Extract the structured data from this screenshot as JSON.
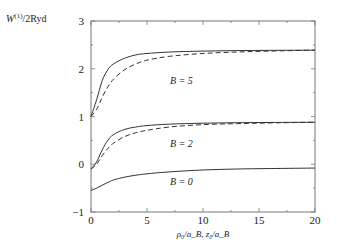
{
  "chart_data": {
    "type": "line",
    "title": "",
    "ylabel": "W^(1)/2Ryd",
    "xlabel": "ρ0/aB, z0/aB",
    "xlim": [
      0,
      20
    ],
    "ylim": [
      -1,
      3
    ],
    "xticks": [
      0,
      5,
      10,
      15,
      20
    ],
    "yticks": [
      -1,
      0,
      1,
      2,
      3
    ],
    "grid": false,
    "legend": "inline annotations",
    "x": [
      0,
      0.5,
      1,
      1.5,
      2,
      3,
      4,
      5,
      7,
      10,
      13,
      16,
      20
    ],
    "series": [
      {
        "name": "B = 5 (solid)",
        "style": "solid",
        "values": [
          1.0,
          1.35,
          1.75,
          1.98,
          2.1,
          2.22,
          2.29,
          2.32,
          2.35,
          2.37,
          2.38,
          2.385,
          2.39
        ]
      },
      {
        "name": "B = 5 (dashed)",
        "style": "dashed",
        "values": [
          1.0,
          1.15,
          1.4,
          1.62,
          1.78,
          1.98,
          2.1,
          2.18,
          2.26,
          2.32,
          2.35,
          2.37,
          2.39
        ]
      },
      {
        "name": "B = 2 (solid)",
        "style": "solid",
        "values": [
          -0.1,
          0.05,
          0.3,
          0.5,
          0.62,
          0.73,
          0.78,
          0.81,
          0.84,
          0.86,
          0.87,
          0.875,
          0.88
        ]
      },
      {
        "name": "B = 2 (dashed)",
        "style": "dashed",
        "values": [
          -0.1,
          0.0,
          0.18,
          0.33,
          0.44,
          0.58,
          0.66,
          0.71,
          0.78,
          0.83,
          0.85,
          0.865,
          0.88
        ]
      },
      {
        "name": "B = 0 (solid)",
        "style": "solid",
        "values": [
          -0.55,
          -0.5,
          -0.44,
          -0.38,
          -0.33,
          -0.27,
          -0.23,
          -0.2,
          -0.16,
          -0.12,
          -0.1,
          -0.09,
          -0.08
        ]
      }
    ],
    "annotations": [
      {
        "text": "B = 5",
        "x": 7.0,
        "y": 1.85
      },
      {
        "text": "B = 2",
        "x": 7.0,
        "y": 0.45
      },
      {
        "text": "B = 0",
        "x": 7.0,
        "y": -0.35
      }
    ]
  },
  "labels": {
    "ylabel_main": "W",
    "ylabel_sup": "(1)",
    "ylabel_rest": "/2Ryd",
    "xlabel": "ρ₀/a_B, z₀/a_B",
    "xticks": [
      "0",
      "5",
      "10",
      "15",
      "20"
    ],
    "yticks": [
      "−1",
      "0",
      "1",
      "2",
      "3"
    ],
    "b5": "B = 5",
    "b2": "B = 2",
    "b0": "B = 0"
  }
}
